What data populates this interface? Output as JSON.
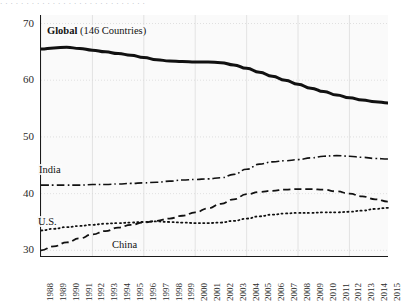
{
  "figure": {
    "cut_caption": "· · · · · · · · · · · · · · · · · · · · · · · · · · · ·",
    "bg_color": "#fafafa",
    "grid_color": "#d9d9d9",
    "axis_color": "#1a1a1a"
  },
  "axes": {
    "y_label": "",
    "y_ticks": [
      "70",
      "60",
      "50",
      "40",
      "30"
    ],
    "y_tick_values": [
      70,
      60,
      50,
      40,
      30
    ],
    "ylim": [
      29.0,
      71.5
    ],
    "x_ticks": [
      "1988",
      "1989",
      "1990",
      "1991",
      "1992",
      "1993",
      "1994",
      "1995",
      "1996",
      "1997",
      "1998",
      "1999",
      "2000",
      "2001",
      "2002",
      "2003",
      "2004",
      "2005",
      "2006",
      "2007",
      "2008",
      "2009",
      "2010",
      "2011",
      "2012",
      "2013",
      "2014",
      "2015"
    ],
    "xlim": [
      1988,
      2015
    ]
  },
  "labels": {
    "global_bold": "Global",
    "global_rest": " (146 Countries)",
    "india": "India",
    "us": "U.S.",
    "china": "China"
  },
  "chart_data": {
    "type": "line",
    "title": "",
    "subtitle": "",
    "xlabel": "",
    "ylabel": "",
    "xlim": [
      1988,
      2015
    ],
    "ylim": [
      29.0,
      71.5
    ],
    "grid": true,
    "legend": "inline-annotations",
    "x": [
      1988,
      1989,
      1990,
      1991,
      1992,
      1993,
      1994,
      1995,
      1996,
      1997,
      1998,
      1999,
      2000,
      2001,
      2002,
      2003,
      2004,
      2005,
      2006,
      2007,
      2008,
      2009,
      2010,
      2011,
      2012,
      2013,
      2014,
      2015
    ],
    "series": [
      {
        "name": "Global (146 Countries)",
        "style": "solid",
        "width": 3.0,
        "color": "#111111",
        "values": [
          65.5,
          65.7,
          65.8,
          65.6,
          65.3,
          65.0,
          64.7,
          64.4,
          64.0,
          63.6,
          63.4,
          63.3,
          63.2,
          63.2,
          63.1,
          62.7,
          62.1,
          61.4,
          60.7,
          60.0,
          59.3,
          58.6,
          58.0,
          57.4,
          56.9,
          56.5,
          56.2,
          56.0
        ]
      },
      {
        "name": "India",
        "style": "dashdot",
        "width": 1.6,
        "color": "#111111",
        "values": [
          41.5,
          41.5,
          41.5,
          41.5,
          41.6,
          41.6,
          41.7,
          41.8,
          41.9,
          42.0,
          42.2,
          42.4,
          42.5,
          42.6,
          42.8,
          43.4,
          44.3,
          45.2,
          45.6,
          45.8,
          46.0,
          46.3,
          46.6,
          46.7,
          46.6,
          46.4,
          46.2,
          46.1
        ]
      },
      {
        "name": "China",
        "style": "dashed",
        "width": 1.8,
        "color": "#111111",
        "values": [
          30.0,
          30.7,
          31.4,
          32.1,
          32.8,
          33.4,
          34.0,
          34.5,
          34.9,
          35.2,
          35.6,
          36.1,
          36.7,
          37.4,
          38.2,
          39.0,
          39.9,
          40.3,
          40.5,
          40.7,
          40.8,
          40.8,
          40.7,
          40.4,
          40.0,
          39.5,
          39.0,
          38.6
        ]
      },
      {
        "name": "U.S.",
        "style": "dotted",
        "width": 1.8,
        "color": "#111111",
        "values": [
          33.5,
          33.8,
          34.1,
          34.3,
          34.5,
          34.7,
          34.8,
          34.9,
          35.0,
          35.1,
          35.0,
          34.9,
          34.8,
          34.8,
          34.9,
          35.2,
          35.6,
          36.0,
          36.3,
          36.5,
          36.6,
          36.6,
          36.7,
          36.7,
          36.8,
          37.0,
          37.3,
          37.5
        ]
      }
    ]
  }
}
